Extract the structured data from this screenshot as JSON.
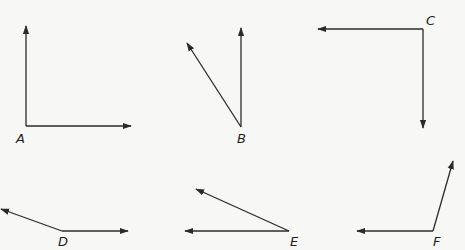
{
  "diagram": {
    "type": "angles",
    "stroke_color": "#2b2b2b",
    "background": "#f7f7f5",
    "angles": [
      {
        "label": "A",
        "vertex": [
          26,
          126
        ],
        "rays": [
          [
            26,
            26
          ],
          [
            131,
            126
          ]
        ],
        "label_pos": [
          16,
          143
        ],
        "kind": "right"
      },
      {
        "label": "B",
        "vertex": [
          241,
          127
        ],
        "rays": [
          [
            241,
            28
          ],
          [
            187,
            43
          ]
        ],
        "label_pos": [
          237,
          143
        ],
        "kind": "acute"
      },
      {
        "label": "C",
        "vertex": [
          423,
          29
        ],
        "rays": [
          [
            318,
            29
          ],
          [
            423,
            128
          ]
        ],
        "label_pos": [
          426,
          25
        ],
        "kind": "right"
      },
      {
        "label": "D",
        "vertex": [
          62,
          231
        ],
        "rays": [
          [
            1,
            209
          ],
          [
            128,
            231
          ]
        ],
        "label_pos": [
          58,
          246
        ],
        "kind": "obtuse"
      },
      {
        "label": "E",
        "vertex": [
          289,
          231
        ],
        "rays": [
          [
            196,
            189
          ],
          [
            185,
            231
          ]
        ],
        "label_pos": [
          290,
          246
        ],
        "kind": "acute"
      },
      {
        "label": "F",
        "vertex": [
          433,
          231
        ],
        "rays": [
          [
            357,
            231
          ],
          [
            453,
            161
          ]
        ],
        "label_pos": [
          433,
          246
        ],
        "kind": "acute"
      }
    ]
  }
}
